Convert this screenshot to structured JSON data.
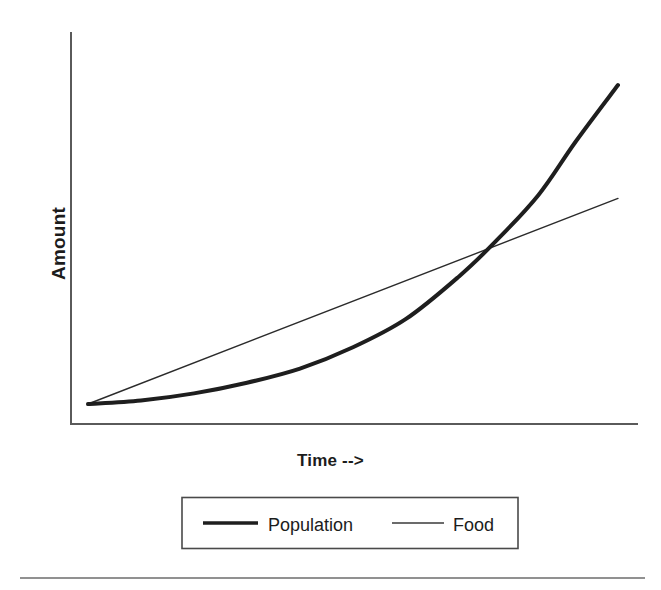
{
  "chart_data": {
    "type": "line",
    "title": "",
    "xlabel": "Time -->",
    "ylabel": "Amount",
    "grid": false,
    "legend_position": "bottom",
    "axis_ticks": {
      "x": [],
      "y": []
    },
    "xlim": [
      0,
      100
    ],
    "ylim": [
      0,
      100
    ],
    "annotations": [],
    "series": [
      {
        "name": "Population",
        "style": "thick",
        "shape": "exponential",
        "color": "#1e1e1e",
        "x": [
          0,
          10,
          20,
          30,
          40,
          50,
          60,
          70,
          77,
          85,
          92,
          100
        ],
        "y": [
          4,
          5,
          7,
          10,
          14,
          20,
          28,
          40,
          50,
          63,
          78,
          94
        ]
      },
      {
        "name": "Food",
        "style": "thin",
        "shape": "linear",
        "color": "#2b2b2b",
        "x": [
          0,
          100
        ],
        "y": [
          4,
          62
        ]
      }
    ]
  },
  "axes": {
    "y_label": "Amount",
    "x_label": "Time -->"
  },
  "legend": {
    "entries": [
      {
        "label": "Population",
        "marker": "thick-line"
      },
      {
        "label": "Food",
        "marker": "thin-line"
      }
    ]
  },
  "footer": {
    "rule": "horizontal-divider"
  },
  "colors": {
    "background": "#ffffff",
    "axis": "#5a5a5a",
    "population": "#1e1e1e",
    "food": "#2b2b2b",
    "legend_border": "#4a4a4a",
    "text": "#1c1c1c",
    "footer_rule": "#6d6d6d"
  }
}
